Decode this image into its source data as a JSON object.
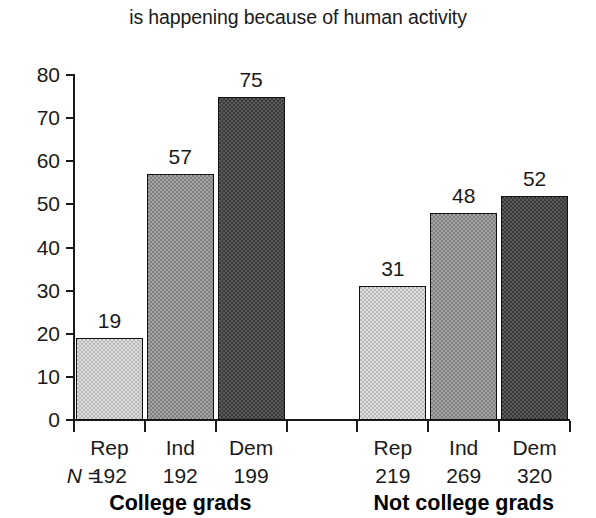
{
  "chart_data": {
    "type": "bar",
    "title": "is happening because of human activity",
    "xlabel": "",
    "ylabel": "",
    "ylim": [
      0,
      80
    ],
    "yticks": [
      0,
      10,
      20,
      30,
      40,
      50,
      60,
      70,
      80
    ],
    "grid": false,
    "legend": "none",
    "categories": [
      "Rep",
      "Ind",
      "Dem",
      "Rep",
      "Ind",
      "Dem"
    ],
    "values": [
      19,
      57,
      75,
      31,
      48,
      52
    ],
    "groups": [
      {
        "label": "College grads",
        "categories": [
          "Rep",
          "Ind",
          "Dem"
        ],
        "values": [
          19,
          57,
          75
        ],
        "n": [
          192,
          192,
          199
        ]
      },
      {
        "label": "Not college grads",
        "categories": [
          "Rep",
          "Ind",
          "Dem"
        ],
        "values": [
          31,
          48,
          52
        ],
        "n": [
          219,
          269,
          320
        ]
      }
    ],
    "n_prefix": "N =",
    "bar_shades": [
      "light",
      "medium",
      "dark"
    ],
    "colors": {
      "light": "#b7b7b7",
      "medium": "#7e7e7e",
      "dark": "#3a3a3a",
      "axis": "#1a1a1a",
      "text": "#1a1a1a",
      "background": "#ffffff"
    }
  }
}
